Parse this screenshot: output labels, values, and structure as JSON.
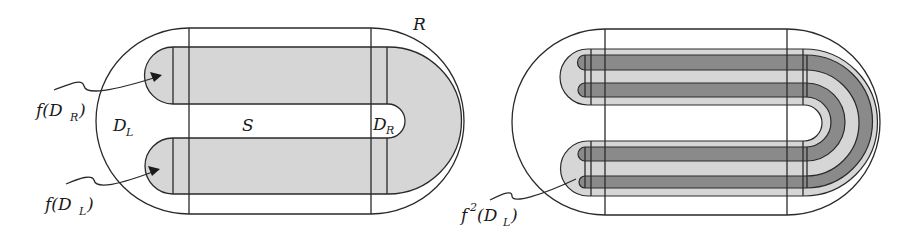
{
  "figure": {
    "left_panel": {
      "labels": {
        "R": "R",
        "S": "S",
        "D_L_base": "D",
        "D_L_sub": "L",
        "D_R_base": "D",
        "D_R_sub": "R",
        "f_DR_prefix": "f(D",
        "f_DR_sub": "R",
        "f_DR_suffix": ")",
        "f_DL_prefix": "f(D",
        "f_DL_sub": "L",
        "f_DL_suffix": ")"
      }
    },
    "right_panel": {
      "labels": {
        "f2_base": "f",
        "f2_sup": "2",
        "f2_open": "(D",
        "f2_sub": "L",
        "f2_close": ")"
      }
    },
    "colors": {
      "outline": "#2a2a2a",
      "light_fill": "#d6d6d6",
      "dark_fill": "#8a8a8a",
      "background": "#ffffff"
    }
  }
}
